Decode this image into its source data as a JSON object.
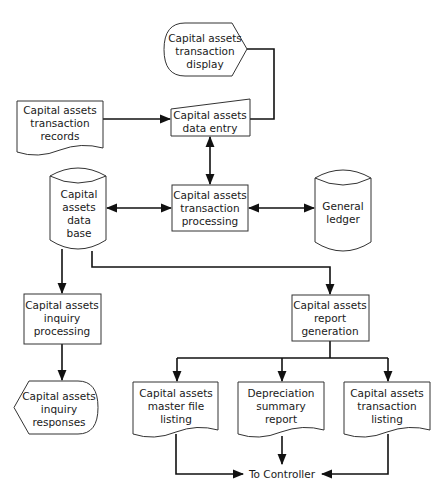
{
  "colors": {
    "stroke": "#333333",
    "line": "#111111",
    "fill": "#ffffff",
    "text": "#1a1a1a"
  },
  "nodes": {
    "transaction_display": {
      "type": "display",
      "lines": [
        "Capital assets",
        "transaction",
        "display"
      ]
    },
    "transaction_records": {
      "type": "document",
      "lines": [
        "Capital assets",
        "transaction",
        "records"
      ]
    },
    "data_entry": {
      "type": "manual-input",
      "lines": [
        "Capital assets",
        "data entry"
      ]
    },
    "database": {
      "type": "disk-storage",
      "lines": [
        "Capital",
        "assets",
        "data",
        "base"
      ]
    },
    "transaction_processing": {
      "type": "process",
      "lines": [
        "Capital assets",
        "transaction",
        "processing"
      ]
    },
    "general_ledger": {
      "type": "disk-storage",
      "lines": [
        "General",
        "ledger"
      ]
    },
    "inquiry_processing": {
      "type": "process",
      "lines": [
        "Capital assets",
        "inquiry",
        "processing"
      ]
    },
    "report_generation": {
      "type": "process",
      "lines": [
        "Capital assets",
        "report",
        "generation"
      ]
    },
    "inquiry_responses": {
      "type": "display",
      "lines": [
        "Capital assets",
        "inquiry",
        "responses"
      ]
    },
    "master_file_listing": {
      "type": "document",
      "lines": [
        "Capital assets",
        "master file",
        "listing"
      ]
    },
    "depreciation_summary": {
      "type": "document",
      "lines": [
        "Depreciation",
        "summary",
        "report"
      ]
    },
    "transaction_listing": {
      "type": "document",
      "lines": [
        "Capital assets",
        "transaction",
        "listing"
      ]
    },
    "to_controller": {
      "type": "terminal-label",
      "lines": [
        "To Controller"
      ]
    }
  },
  "edges": [
    {
      "from": "transaction_records",
      "to": "data_entry",
      "direction": "forward"
    },
    {
      "from": "transaction_display",
      "to": "data_entry",
      "direction": "none"
    },
    {
      "from": "data_entry",
      "to": "transaction_processing",
      "direction": "both"
    },
    {
      "from": "database",
      "to": "transaction_processing",
      "direction": "both"
    },
    {
      "from": "transaction_processing",
      "to": "general_ledger",
      "direction": "both"
    },
    {
      "from": "database",
      "to": "inquiry_processing",
      "direction": "forward"
    },
    {
      "from": "database",
      "to": "report_generation",
      "direction": "forward"
    },
    {
      "from": "inquiry_processing",
      "to": "inquiry_responses",
      "direction": "forward"
    },
    {
      "from": "report_generation",
      "to": "master_file_listing",
      "direction": "forward"
    },
    {
      "from": "report_generation",
      "to": "depreciation_summary",
      "direction": "forward"
    },
    {
      "from": "report_generation",
      "to": "transaction_listing",
      "direction": "forward"
    },
    {
      "from": "master_file_listing",
      "to": "to_controller",
      "direction": "forward"
    },
    {
      "from": "depreciation_summary",
      "to": "to_controller",
      "direction": "forward"
    },
    {
      "from": "transaction_listing",
      "to": "to_controller",
      "direction": "forward"
    }
  ]
}
